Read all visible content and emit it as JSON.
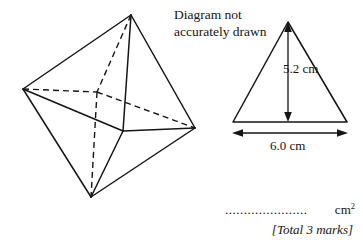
{
  "page": {
    "width": 363,
    "height": 245,
    "background": "#ffffff",
    "ink": "#151515"
  },
  "note": {
    "text": "Diagram not\naccurately drawn"
  },
  "solid": {
    "name": "octahedron",
    "description": "Octahedron drawn with solid visible edges and dashed hidden edges",
    "vertices": {
      "top": [
        131,
        15
      ],
      "left": [
        23,
        89
      ],
      "back_hidden": [
        97,
        92
      ],
      "front": [
        123,
        131
      ],
      "right": [
        195,
        128
      ],
      "bottom": [
        91,
        197
      ]
    },
    "solid_edges": [
      [
        "top",
        "left"
      ],
      [
        "top",
        "right"
      ],
      [
        "top",
        "front"
      ],
      [
        "left",
        "front"
      ],
      [
        "left",
        "bottom"
      ],
      [
        "front",
        "right"
      ],
      [
        "front",
        "bottom"
      ],
      [
        "right",
        "bottom"
      ]
    ],
    "dashed_edges": [
      [
        "top",
        "back_hidden"
      ],
      [
        "left",
        "back_hidden"
      ],
      [
        "back_hidden",
        "right"
      ],
      [
        "back_hidden",
        "bottom"
      ]
    ],
    "stroke": "#151515",
    "stroke_width": 1.4,
    "dash_pattern": "6,4"
  },
  "triangle": {
    "name": "face-triangle",
    "apex": [
      288,
      22
    ],
    "base_left": [
      233,
      122
    ],
    "base_right": [
      347,
      122
    ],
    "stroke": "#151515",
    "stroke_width": 1.4,
    "height_arrow": {
      "x": 288,
      "y_top": 24,
      "y_bottom": 120,
      "label": "5.2 cm"
    },
    "base_arrow": {
      "y": 133,
      "x_left": 233,
      "x_right": 347,
      "label": "6.0 cm"
    }
  },
  "dimensions": {
    "height_label": "5.2 cm",
    "base_label": "6.0 cm",
    "height_value": 5.2,
    "base_value": 6.0,
    "unit": "cm"
  },
  "answer": {
    "dots": "......................",
    "units": "cm",
    "units_exponent": "2"
  },
  "marks": {
    "text": "[Total 3 marks]"
  }
}
